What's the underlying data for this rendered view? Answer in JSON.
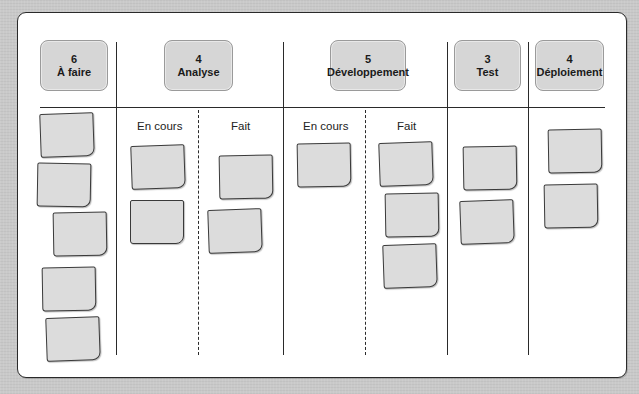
{
  "board": {
    "columns": [
      {
        "id": "todo",
        "count": "6",
        "title": "À faire",
        "cards": 5
      },
      {
        "id": "analysis",
        "count": "4",
        "title": "Analyse",
        "subcolumns": [
          {
            "label": "En cours",
            "cards": 2
          },
          {
            "label": "Fait",
            "cards": 2
          }
        ]
      },
      {
        "id": "development",
        "count": "5",
        "title": "Développement",
        "subcolumns": [
          {
            "label": "En cours",
            "cards": 1
          },
          {
            "label": "Fait",
            "cards": 3
          }
        ]
      },
      {
        "id": "test",
        "count": "3",
        "title": "Test",
        "cards": 2
      },
      {
        "id": "deployment",
        "count": "4",
        "title": "Déploiement",
        "cards": 2
      }
    ]
  },
  "colors": {
    "background": "#c9c9c9",
    "board": "#ffffff",
    "header_fill": "#d6d6d6",
    "card_fill": "#dcdcdc",
    "line": "#2a2a2a"
  }
}
